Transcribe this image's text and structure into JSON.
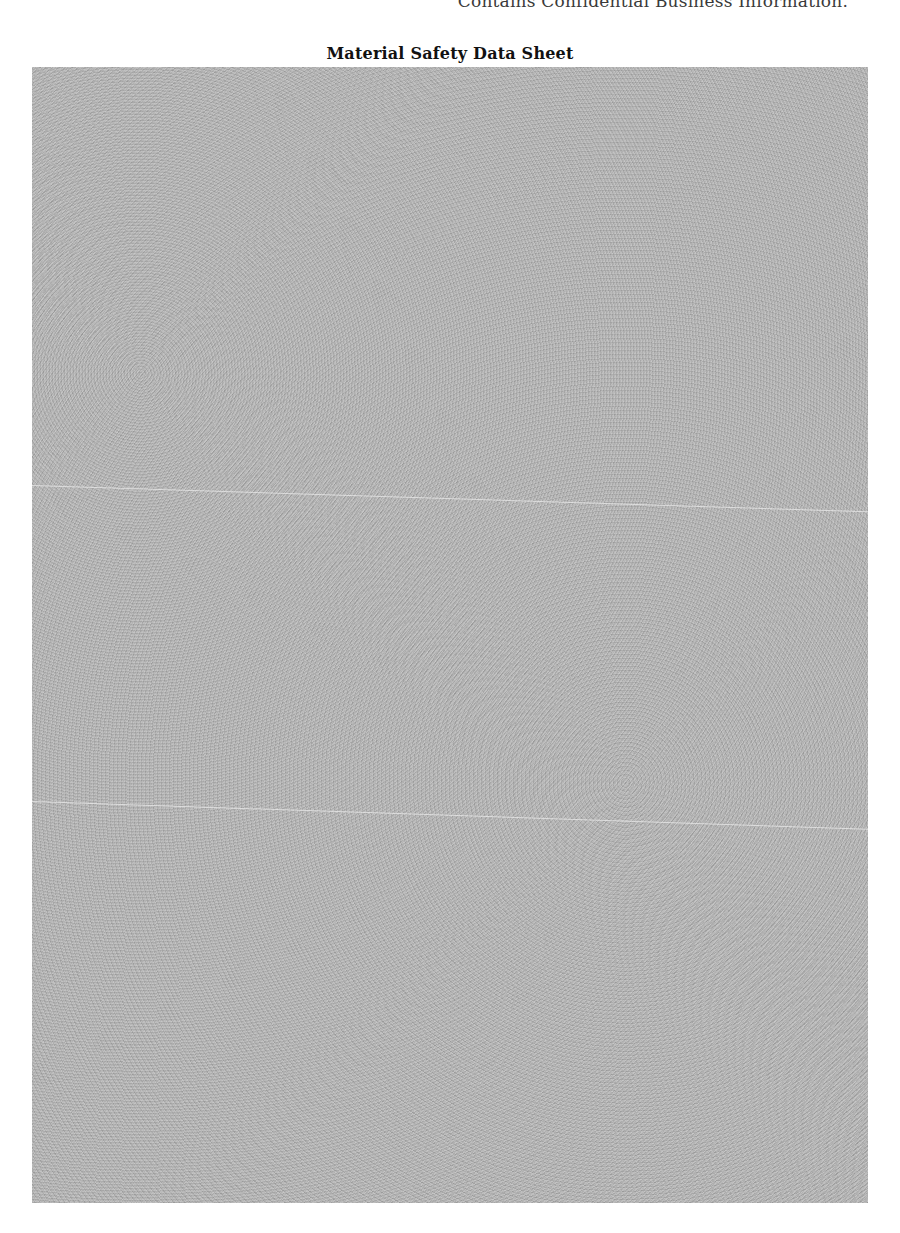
{
  "header": {
    "confidentiality_notice": "Contains Confidential Business Information."
  },
  "document": {
    "title": "Material Safety Data Sheet",
    "body_state": "redacted"
  },
  "colors": {
    "redaction_gray": "#b9b9b9",
    "page_background": "#ffffff"
  }
}
